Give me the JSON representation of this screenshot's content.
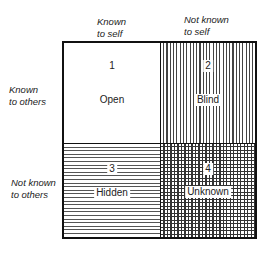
{
  "diagram": {
    "type": "johari-window",
    "columns": [
      {
        "label_line1": "Known",
        "label_line2": "to self"
      },
      {
        "label_line1": "Not known",
        "label_line2": "to self"
      }
    ],
    "rows": [
      {
        "label_line1": "Known",
        "label_line2": "to others"
      },
      {
        "label_line1": "Not known",
        "label_line2": "to others"
      }
    ],
    "cells": [
      {
        "number": "1",
        "name": "Open",
        "pattern": "none"
      },
      {
        "number": "2",
        "name": "Blind",
        "pattern": "vertical-lines"
      },
      {
        "number": "3",
        "name": "Hidden",
        "pattern": "horizontal-lines"
      },
      {
        "number": "4",
        "name": "Unknown",
        "pattern": "crosshatch"
      }
    ]
  }
}
